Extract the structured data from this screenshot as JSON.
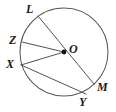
{
  "figure": {
    "shape_type": "circle-geometry-diagram",
    "stroke_color": "#5a5a5a",
    "label_color": "#1a1a1a",
    "background_color": "#ffffff",
    "circle": {
      "center_label": "O",
      "center_x": 64,
      "center_y": 52,
      "radius": 44
    },
    "points": [
      {
        "id": "L",
        "label": "L",
        "x": 38,
        "y": 16,
        "label_x": 26,
        "label_y": 3
      },
      {
        "id": "Z",
        "label": "Z",
        "x": 22,
        "y": 42,
        "label_x": 9,
        "label_y": 34
      },
      {
        "id": "O",
        "label": "O",
        "x": 64,
        "y": 52,
        "label_x": 69,
        "label_y": 43
      },
      {
        "id": "X",
        "label": "X",
        "x": 21,
        "y": 65,
        "label_x": 6,
        "label_y": 58
      },
      {
        "id": "Y",
        "label": "Y",
        "x": 86,
        "y": 94,
        "label_x": 79,
        "label_y": 96
      },
      {
        "id": "M",
        "label": "M",
        "x": 94,
        "y": 84,
        "label_x": 97,
        "label_y": 81
      }
    ],
    "segments": [
      {
        "id": "LM",
        "from": "L",
        "to": "M",
        "kind": "diameter"
      },
      {
        "id": "ZO",
        "from": "Z",
        "to": "O",
        "kind": "radius"
      },
      {
        "id": "XO",
        "from": "X",
        "to": "O",
        "kind": "radius"
      },
      {
        "id": "XY",
        "from": "X",
        "to": "Y",
        "kind": "chord"
      }
    ]
  }
}
